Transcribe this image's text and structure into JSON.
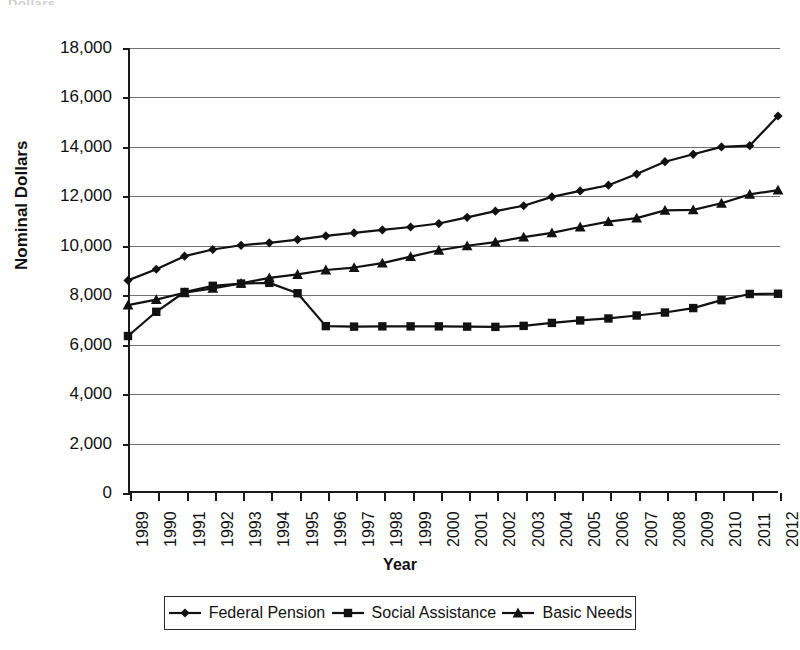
{
  "page": {
    "cropped_header_text": "Dollars"
  },
  "chart_data": {
    "type": "line",
    "title": "",
    "xlabel": "Year",
    "ylabel": "Nominal Dollars",
    "ylim": [
      0,
      18000
    ],
    "yticks": [
      0,
      2000,
      4000,
      6000,
      8000,
      10000,
      12000,
      14000,
      16000,
      18000
    ],
    "ytick_labels": [
      "0",
      "2,000",
      "4,000",
      "6,000",
      "8,000",
      "10,000",
      "12,000",
      "14,000",
      "16,000",
      "18,000"
    ],
    "grid": true,
    "legend_position": "bottom",
    "categories": [
      "1989",
      "1990",
      "1991",
      "1992",
      "1993",
      "1994",
      "1995",
      "1996",
      "1997",
      "1998",
      "1999",
      "2000",
      "2001",
      "2002",
      "2003",
      "2004",
      "2005",
      "2006",
      "2007",
      "2008",
      "2009",
      "2010",
      "2011",
      "2012"
    ],
    "series": [
      {
        "name": "Federal Pension",
        "marker": "diamond",
        "color": "#111111",
        "values": [
          8600,
          9050,
          9580,
          9850,
          10020,
          10120,
          10250,
          10400,
          10520,
          10640,
          10760,
          10900,
          11150,
          11400,
          11620,
          11980,
          12220,
          12450,
          12900,
          13400,
          13700,
          14000,
          14050,
          15250
        ]
      },
      {
        "name": "Social Assistance",
        "marker": "square",
        "color": "#111111",
        "values": [
          6350,
          7330,
          8130,
          8380,
          8470,
          8500,
          8080,
          6750,
          6730,
          6740,
          6740,
          6740,
          6730,
          6720,
          6760,
          6880,
          6980,
          7060,
          7180,
          7300,
          7480,
          7800,
          8050,
          8060
        ]
      },
      {
        "name": "Basic Needs",
        "marker": "triangle",
        "color": "#111111",
        "values": [
          7600,
          7820,
          8100,
          8280,
          8480,
          8700,
          8840,
          9020,
          9120,
          9300,
          9560,
          9820,
          10000,
          10150,
          10350,
          10520,
          10760,
          10980,
          11120,
          11430,
          11450,
          11720,
          12080,
          12250
        ]
      }
    ]
  }
}
